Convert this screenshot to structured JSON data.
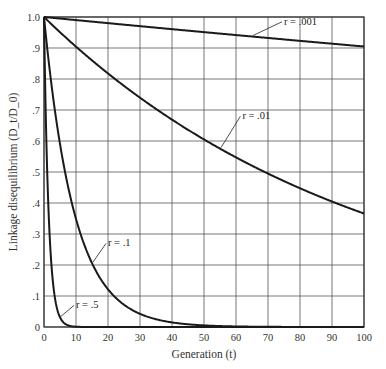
{
  "chart_data": {
    "type": "line",
    "title": "",
    "xlabel": "Generation (t)",
    "ylabel": "Linkage disequilibrium (D_t/D_0)",
    "xlim": [
      0,
      100
    ],
    "ylim": [
      0,
      1.0
    ],
    "grid": true,
    "legend": "none (inline curve labels)",
    "formula": "D_t/D_0 = (1 - r)^t",
    "x_ticks": [
      0,
      10,
      20,
      30,
      40,
      50,
      60,
      70,
      80,
      90,
      100
    ],
    "x_tick_labels": [
      "0",
      "10",
      "20",
      "30",
      "40",
      "50",
      "60",
      "70",
      "80",
      "90",
      "100"
    ],
    "y_ticks": [
      0,
      0.1,
      0.2,
      0.3,
      0.4,
      0.5,
      0.6,
      0.7,
      0.8,
      0.9,
      1.0
    ],
    "y_tick_labels": [
      "0",
      ".1",
      ".2",
      ".3",
      ".4",
      ".5",
      ".6",
      ".7",
      ".8",
      ".9",
      "1.0"
    ],
    "x": [
      0,
      10,
      20,
      30,
      40,
      50,
      60,
      70,
      80,
      90,
      100
    ],
    "series": [
      {
        "name": "r = .001",
        "r": 0.001,
        "label": "r = .001",
        "label_x": 75,
        "label_y": 0.975,
        "values": [
          1.0,
          0.99,
          0.98,
          0.97,
          0.961,
          0.951,
          0.942,
          0.932,
          0.923,
          0.914,
          0.905
        ]
      },
      {
        "name": "r = .01",
        "r": 0.01,
        "label": "r = .01",
        "label_x": 62,
        "label_y": 0.67,
        "values": [
          1.0,
          0.904,
          0.818,
          0.74,
          0.669,
          0.605,
          0.547,
          0.495,
          0.448,
          0.405,
          0.366
        ]
      },
      {
        "name": "r = .1",
        "r": 0.1,
        "label": "r = .1",
        "label_x": 20,
        "label_y": 0.26,
        "values": [
          1.0,
          0.349,
          0.122,
          0.042,
          0.015,
          0.005,
          0.002,
          0.001,
          0.0,
          0.0,
          0.0
        ]
      },
      {
        "name": "r = .5",
        "r": 0.5,
        "label": "r = .5",
        "label_x": 10,
        "label_y": 0.06,
        "values": [
          1.0,
          0.001,
          0.0,
          0.0,
          0.0,
          0.0,
          0.0,
          0.0,
          0.0,
          0.0,
          0.0
        ]
      }
    ]
  },
  "colors": {
    "curve": "#1a1a1a",
    "grid": "#555555",
    "text": "#333333"
  }
}
